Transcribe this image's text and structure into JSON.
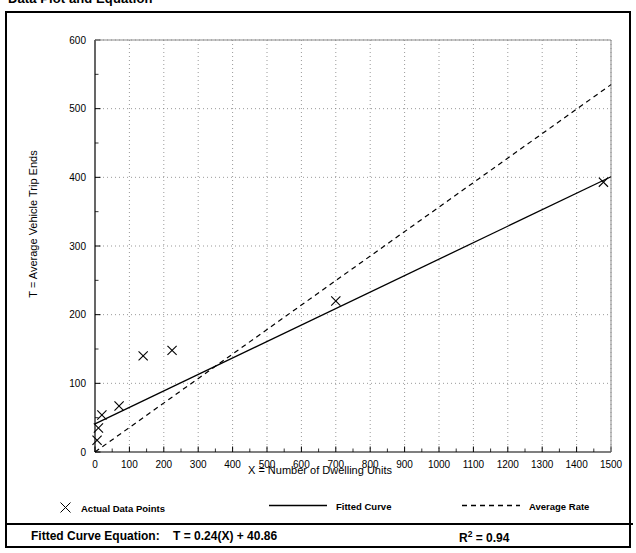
{
  "figure": {
    "title": "Data Plot and Equation"
  },
  "legend": {
    "points_label": "Actual Data Points",
    "fitted_label": "Fitted Curve",
    "average_label": "Average Rate"
  },
  "equation": {
    "label": "Fitted Curve Equation:",
    "expression": "T = 0.24(X) + 40.86",
    "rsq_prefix": "R",
    "rsq_exponent": "2",
    "rsq_value": "= 0.94"
  },
  "chart_data": {
    "type": "scatter",
    "title": "Data Plot and Equation",
    "xlabel": "X = Number of Dwelling Units",
    "ylabel": "T = Average Vehicle Trip Ends",
    "xlim": [
      0,
      1500
    ],
    "ylim": [
      0,
      600
    ],
    "xticks": [
      0,
      100,
      200,
      300,
      400,
      500,
      600,
      700,
      800,
      900,
      1000,
      1100,
      1200,
      1300,
      1400,
      1500
    ],
    "yticks": [
      0,
      100,
      200,
      300,
      400,
      500,
      600
    ],
    "xtick_labels": [
      "0",
      "100",
      "200",
      "300",
      "400",
      "500",
      "600",
      "700",
      "800",
      "900",
      "1000",
      "1100",
      "1200",
      "1300",
      "1400",
      "1500"
    ],
    "ytick_labels": [
      "0",
      "100",
      "200",
      "300",
      "400",
      "500",
      "600"
    ],
    "x_minor_tick_interval": 50,
    "y_minor_tick_interval": 50,
    "grid": true,
    "grid_style": "dotted",
    "legend_position": "below-plot",
    "series": [
      {
        "name": "Actual Data Points",
        "type": "scatter",
        "marker": "x",
        "color": "#000000",
        "points": [
          {
            "x": 6,
            "y": 17
          },
          {
            "x": 10,
            "y": 35
          },
          {
            "x": 20,
            "y": 54
          },
          {
            "x": 70,
            "y": 67
          },
          {
            "x": 140,
            "y": 140
          },
          {
            "x": 224,
            "y": 148
          },
          {
            "x": 700,
            "y": 220
          },
          {
            "x": 1478,
            "y": 393
          }
        ]
      },
      {
        "name": "Fitted Curve",
        "type": "line",
        "style": "solid",
        "color": "#000000",
        "equation": "T = 0.24(X) + 40.86",
        "slope": 0.24,
        "intercept": 40.86,
        "r_squared": 0.94,
        "x": [
          0,
          1500
        ],
        "y": [
          40.86,
          400.86
        ]
      },
      {
        "name": "Average Rate",
        "type": "line",
        "style": "dashed",
        "color": "#000000",
        "slope": 0.3567,
        "intercept": 0,
        "x": [
          0,
          1500
        ],
        "y": [
          0,
          535
        ]
      }
    ]
  }
}
